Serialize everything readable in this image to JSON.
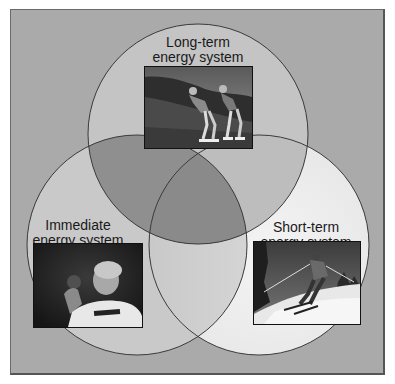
{
  "diagram": {
    "type": "venn-3",
    "colors": {
      "background": "#aaaaaa",
      "top_only": "#c4c4c4",
      "left_only": "#c9c9c9",
      "right_only": "#ececec",
      "top_left": "#8f8f8f",
      "top_right": "#bdbdbd",
      "left_right": "#d4d4d4",
      "center": "#8a8a8a",
      "outline": "#3a3a3a"
    },
    "circles": [
      {
        "id": "long-term",
        "label_line1": "Long-term",
        "label_line2": "energy system",
        "photo_desc": "Two inline skaters on a grassy hillside"
      },
      {
        "id": "immediate",
        "label_line1": "Immediate",
        "label_line2": "energy system",
        "photo_desc": "Shot putter preparing to throw"
      },
      {
        "id": "short-term",
        "label_line1": "Short-term",
        "label_line2": "energy system",
        "photo_desc": "Skier descending a snowy slope"
      }
    ]
  }
}
